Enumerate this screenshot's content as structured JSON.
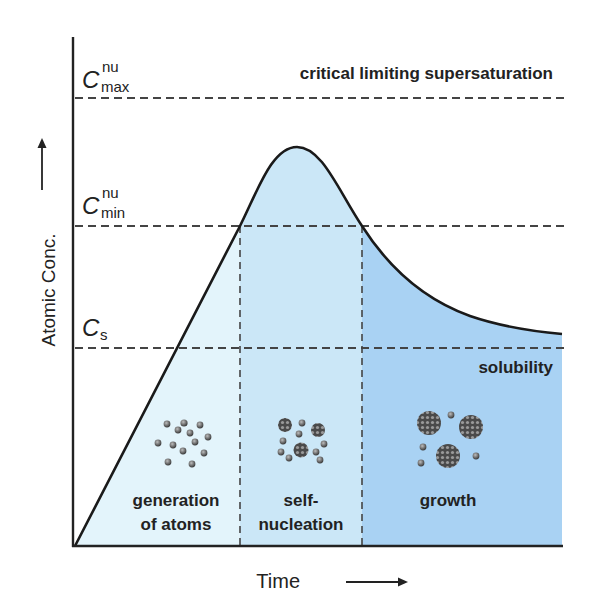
{
  "axes": {
    "y_label": "Atomic Conc.",
    "x_label": "Time"
  },
  "levels": {
    "c_max": {
      "symbol": "C",
      "sup": "nu",
      "sub": "max",
      "line_label": "critical limiting supersaturation"
    },
    "c_min": {
      "symbol": "C",
      "sup": "nu",
      "sub": "min"
    },
    "c_s": {
      "symbol": "C",
      "sub": "s",
      "line_label": "solubility"
    }
  },
  "stages": [
    {
      "line1": "generation",
      "line2": "of atoms",
      "color": "#e3f4fb"
    },
    {
      "line1": "self-",
      "line2": "nucleation",
      "color": "#cbe7f7"
    },
    {
      "line1": "growth",
      "line2": "",
      "color": "#a9d2f3"
    }
  ],
  "colors": {
    "curve": "#1a1a1a",
    "dash": "#444444",
    "particle": "#6b6b6b"
  }
}
